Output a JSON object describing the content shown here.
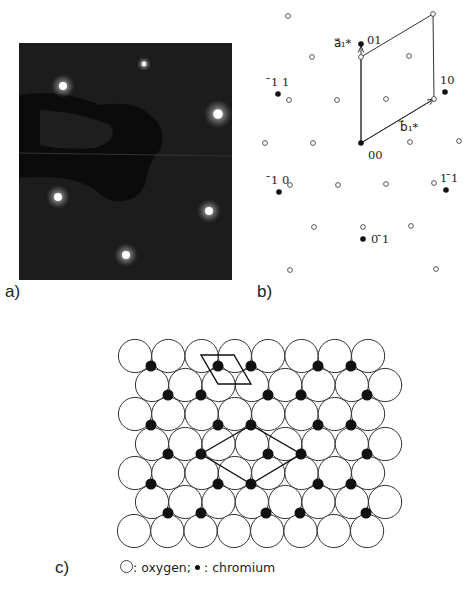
{
  "panels": {
    "a": {
      "label": "a)"
    },
    "b": {
      "label": "b)"
    },
    "c": {
      "label": "c)"
    }
  },
  "leed_photo": {
    "frame": {
      "x": 19,
      "y": 43,
      "w": 213,
      "h": 237
    },
    "background": "#1c1c1c",
    "spots": [
      {
        "x": 63,
        "y": 86,
        "r": 5
      },
      {
        "x": 218,
        "y": 114,
        "r": 6
      },
      {
        "x": 58,
        "y": 197,
        "r": 5
      },
      {
        "x": 209,
        "y": 211,
        "r": 5
      },
      {
        "x": 126,
        "y": 255,
        "r": 5
      },
      {
        "x": 144,
        "y": 64,
        "r": 3
      }
    ]
  },
  "reciprocal_lattice": {
    "open_points": [
      [
        288,
        16
      ],
      [
        433,
        14
      ],
      [
        312,
        57
      ],
      [
        361,
        57
      ],
      [
        409,
        56
      ],
      [
        289,
        100
      ],
      [
        337,
        100
      ],
      [
        386,
        99
      ],
      [
        434,
        99
      ],
      [
        265,
        143
      ],
      [
        313,
        143
      ],
      [
        410,
        142
      ],
      [
        459,
        141
      ],
      [
        290,
        185
      ],
      [
        338,
        185
      ],
      [
        386,
        184
      ],
      [
        434,
        183
      ],
      [
        314,
        227
      ],
      [
        363,
        227
      ],
      [
        411,
        226
      ],
      [
        290,
        270
      ],
      [
        436,
        269
      ]
    ],
    "filled_points": [
      {
        "x": 361,
        "y": 44,
        "label": "01",
        "lx": 367,
        "ly": 44
      },
      {
        "x": 278,
        "y": 94,
        "label": "̄1 1",
        "lx": 271,
        "ly": 86
      },
      {
        "x": 445,
        "y": 92,
        "label": "10",
        "lx": 440,
        "ly": 84
      },
      {
        "x": 361,
        "y": 143,
        "label": "00",
        "lx": 368,
        "ly": 159
      },
      {
        "x": 279,
        "y": 192,
        "label": "̄1 0",
        "lx": 271,
        "ly": 184
      },
      {
        "x": 446,
        "y": 190,
        "label": "1 ̄1",
        "lx": 440,
        "ly": 182
      },
      {
        "x": 363,
        "y": 239,
        "label": "0 ̄1",
        "lx": 371,
        "ly": 243
      }
    ],
    "index_labels": [
      "01",
      "̄1 1",
      "10",
      "00",
      "̄1 0",
      "1 ̄1",
      "0 ̄1"
    ],
    "vectors": {
      "a1": {
        "label": "a⃗₁*",
        "from": [
          361,
          143
        ],
        "to": [
          361,
          46
        ],
        "lx": 334,
        "ly": 47
      },
      "b1": {
        "label": "b⃗₁*",
        "from": [
          361,
          143
        ],
        "to": [
          434,
          99
        ],
        "lx": 400,
        "ly": 131
      }
    },
    "unit_cell": [
      [
        361,
        143
      ],
      [
        361,
        57
      ],
      [
        433,
        14
      ],
      [
        434,
        99
      ]
    ]
  },
  "real_space": {
    "oxygen_radius": 16.6,
    "oxygen_rows": [
      {
        "y": 356,
        "x0": 135,
        "n": 8
      },
      {
        "y": 385,
        "x0": 152,
        "n": 8
      },
      {
        "y": 414,
        "x0": 135,
        "n": 8
      },
      {
        "y": 444,
        "x0": 152,
        "n": 8
      },
      {
        "y": 473,
        "x0": 135,
        "n": 8
      },
      {
        "y": 502,
        "x0": 152,
        "n": 8
      },
      {
        "y": 531,
        "x0": 134,
        "n": 8
      }
    ],
    "x_step": 33.3,
    "chromium_radius": 5.5,
    "chromium_rows": [
      {
        "y": 366,
        "xs": [
          151,
          218,
          251,
          318,
          351
        ]
      },
      {
        "y": 395,
        "xs": [
          168,
          201,
          268,
          301,
          367
        ]
      },
      {
        "y": 425,
        "xs": [
          151,
          218,
          251,
          318,
          351
        ]
      },
      {
        "y": 454,
        "xs": [
          168,
          201,
          268,
          301,
          367
        ]
      },
      {
        "y": 484,
        "xs": [
          151,
          218,
          251,
          318,
          351
        ]
      },
      {
        "y": 513,
        "xs": [
          168,
          201,
          266,
          300,
          366
        ]
      }
    ],
    "small_cell": [
      [
        201,
        355
      ],
      [
        234,
        355
      ],
      [
        251,
        384
      ],
      [
        218,
        384
      ]
    ],
    "large_cell": [
      [
        201,
        454
      ],
      [
        251,
        425
      ],
      [
        301,
        454
      ],
      [
        251,
        484
      ]
    ]
  },
  "legend": {
    "oxygen_sep": ": ",
    "oxygen_text": "oxygen;",
    "chromium_sep": ": ",
    "chromium_text": "chromium"
  },
  "colors": {
    "ink": "#222222",
    "photo_bg": "#1c1c1c",
    "spot": "#f4f4f4"
  }
}
